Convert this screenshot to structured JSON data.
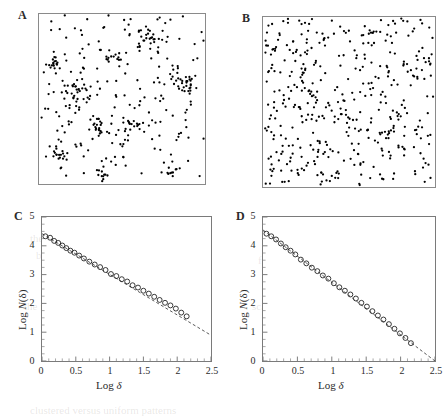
{
  "figure": {
    "panels": [
      {
        "id": "A",
        "label": "A",
        "type": "scatter-clustered",
        "caption_hidden": ""
      },
      {
        "id": "B",
        "label": "B",
        "type": "scatter-uniform",
        "caption_hidden": ""
      },
      {
        "id": "C",
        "label": "C",
        "type": "loglog",
        "caption_hidden": ""
      },
      {
        "id": "D",
        "label": "D",
        "type": "loglog",
        "caption_hidden": ""
      }
    ]
  },
  "chart_data": [
    {
      "panel": "A",
      "type": "scatter",
      "title": "",
      "xlabel": "",
      "ylabel": "",
      "xlim": [
        0,
        1
      ],
      "ylim": [
        0,
        1
      ],
      "grid": false,
      "legend": "none",
      "description": "Clustered (fractal) spatial point pattern",
      "n_points": 420,
      "marker": "filled-circle",
      "marker_color": "#000000",
      "clusters": [
        {
          "cx": 0.115,
          "cy": 0.175,
          "n": 16,
          "spread": 0.03
        },
        {
          "cx": 0.355,
          "cy": 0.33,
          "n": 22,
          "spread": 0.028
        },
        {
          "cx": 0.225,
          "cy": 0.545,
          "n": 34,
          "spread": 0.045
        },
        {
          "cx": 0.545,
          "cy": 0.33,
          "n": 18,
          "spread": 0.032
        },
        {
          "cx": 0.885,
          "cy": 0.585,
          "n": 26,
          "spread": 0.038
        },
        {
          "cx": 0.108,
          "cy": 0.715,
          "n": 15,
          "spread": 0.026
        },
        {
          "cx": 0.655,
          "cy": 0.845,
          "n": 24,
          "spread": 0.034
        },
        {
          "cx": 0.385,
          "cy": 0.055,
          "n": 12,
          "spread": 0.025
        },
        {
          "cx": 0.805,
          "cy": 0.085,
          "n": 10,
          "spread": 0.024
        },
        {
          "cx": 0.455,
          "cy": 0.735,
          "n": 14,
          "spread": 0.03
        }
      ],
      "background_points": 190
    },
    {
      "panel": "B",
      "type": "scatter",
      "title": "",
      "xlabel": "",
      "ylabel": "",
      "xlim": [
        0,
        1
      ],
      "ylim": [
        0,
        1
      ],
      "grid": false,
      "legend": "none",
      "description": "Uniform random (Poisson) spatial point pattern",
      "n_points": 430,
      "marker": "filled-circle",
      "marker_color": "#000000"
    },
    {
      "panel": "C",
      "type": "scatter",
      "title": "",
      "xlabel": "Log δ",
      "ylabel": "Log N(δ)",
      "xlim": [
        0,
        2.5
      ],
      "ylim": [
        0,
        5
      ],
      "xticks": [
        0,
        0.5,
        1,
        1.5,
        2,
        2.5
      ],
      "xticklabels": [
        "0",
        "0.5",
        "1",
        "1.5",
        "2",
        "2.5"
      ],
      "yticks": [
        0,
        1,
        2,
        3,
        4,
        5
      ],
      "yticklabels": [
        "0",
        "1",
        "2",
        "3",
        "4",
        "5"
      ],
      "grid": false,
      "legend": "none",
      "marker": "open-circle",
      "fit_line": {
        "style": "dashed",
        "intercept": 4.42,
        "slope": -1.41,
        "x_from": 0,
        "x_to": 2.5
      },
      "x": [
        0.05,
        0.12,
        0.18,
        0.24,
        0.3,
        0.36,
        0.42,
        0.48,
        0.55,
        0.62,
        0.7,
        0.78,
        0.86,
        0.94,
        1.02,
        1.1,
        1.18,
        1.26,
        1.34,
        1.42,
        1.5,
        1.58,
        1.66,
        1.74,
        1.82,
        1.9,
        1.98,
        2.06,
        2.14
      ],
      "y": [
        4.33,
        4.28,
        4.17,
        4.1,
        4.01,
        3.92,
        3.83,
        3.76,
        3.66,
        3.56,
        3.45,
        3.35,
        3.26,
        3.16,
        3.02,
        2.95,
        2.84,
        2.76,
        2.63,
        2.55,
        2.44,
        2.34,
        2.23,
        2.12,
        2.02,
        1.93,
        1.82,
        1.68,
        1.55
      ]
    },
    {
      "panel": "D",
      "type": "scatter",
      "title": "",
      "xlabel": "Log δ",
      "ylabel": "Log N(δ)",
      "xlim": [
        0,
        2.5
      ],
      "ylim": [
        0,
        5
      ],
      "xticks": [
        0,
        0.5,
        1,
        1.5,
        2,
        2.5
      ],
      "xticklabels": [
        "0",
        "0.5",
        "1",
        "1.5",
        "2",
        "2.5"
      ],
      "yticks": [
        0,
        1,
        2,
        3,
        4,
        5
      ],
      "yticklabels": [
        "0",
        "1",
        "2",
        "3",
        "4",
        "5"
      ],
      "grid": false,
      "legend": "none",
      "marker": "open-circle",
      "fit_line": {
        "style": "dashed",
        "intercept": 4.55,
        "slope": -1.82,
        "x_from": 0,
        "x_to": 2.5
      },
      "x": [
        0.05,
        0.12,
        0.19,
        0.26,
        0.33,
        0.4,
        0.47,
        0.55,
        0.63,
        0.71,
        0.79,
        0.87,
        0.95,
        1.03,
        1.11,
        1.19,
        1.27,
        1.35,
        1.43,
        1.51,
        1.59,
        1.67,
        1.75,
        1.83,
        1.91,
        1.99,
        2.07,
        2.15
      ],
      "y": [
        4.42,
        4.33,
        4.22,
        4.08,
        3.95,
        3.83,
        3.7,
        3.52,
        3.39,
        3.24,
        3.12,
        2.97,
        2.86,
        2.7,
        2.56,
        2.44,
        2.31,
        2.17,
        2.02,
        1.89,
        1.73,
        1.58,
        1.44,
        1.28,
        1.12,
        0.96,
        0.8,
        0.62
      ]
    }
  ]
}
